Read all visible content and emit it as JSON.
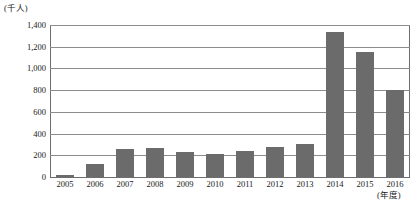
{
  "chart_data": {
    "type": "bar",
    "title": "",
    "subtitle": "",
    "xlabel": "(年度)",
    "ylabel": "(千人)",
    "unit_top_label": "(千人)",
    "unit_right_label": "(年度)",
    "categories": [
      "2005",
      "2006",
      "2007",
      "2008",
      "2009",
      "2010",
      "2011",
      "2012",
      "2013",
      "2014",
      "2015",
      "2016"
    ],
    "values": [
      15,
      120,
      260,
      265,
      230,
      210,
      240,
      275,
      305,
      1340,
      1150,
      800
    ],
    "series": [
      {
        "name": "人数",
        "values": [
          15,
          120,
          260,
          265,
          230,
          210,
          240,
          275,
          305,
          1340,
          1150,
          800
        ]
      }
    ],
    "ylim": [
      0,
      1400
    ],
    "ytick_values": [
      0,
      200,
      400,
      600,
      800,
      1000,
      1200,
      1400
    ],
    "ytick_labels": [
      "0",
      "200",
      "400",
      "600",
      "800",
      "1,000",
      "1,200",
      "1,400"
    ],
    "grid": true,
    "legend": false,
    "legend_position": "none",
    "bar_color": "#6b6b6b",
    "grid_color": "#8c8c8c",
    "axis_color": "#6e6e6e",
    "background_color": "#ffffff"
  }
}
